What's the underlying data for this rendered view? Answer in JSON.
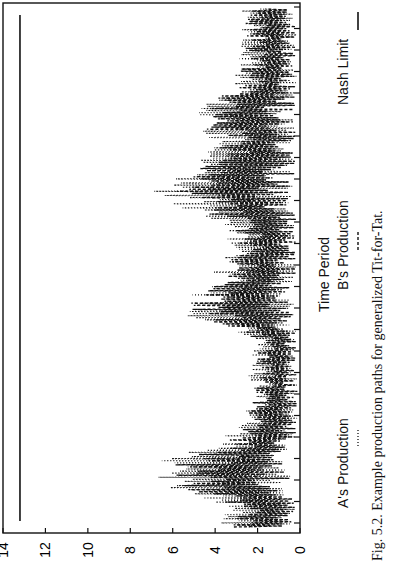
{
  "chart_data": {
    "type": "line",
    "orientation": "rotated-90-ccw",
    "title": "",
    "caption": "Fig. 5.2. Example production paths for generalized Tit-for-Tat.",
    "xlabel": "Time Period",
    "ylabel": "",
    "ylim": [
      0,
      14
    ],
    "yticks": [
      "0",
      "2",
      "4",
      "6",
      "8",
      "10",
      "12",
      "14"
    ],
    "grid": false,
    "legend": [
      {
        "name": "A's Production",
        "style": "dotted"
      },
      {
        "name": "B's Production",
        "style": "dashed"
      },
      {
        "name": "Nash Limit",
        "style": "solid"
      }
    ],
    "legend_position": "bottom",
    "x_range": [
      0,
      250
    ],
    "series": [
      {
        "name": "A's Production",
        "style": "dotted",
        "envelope": [
          [
            0,
            4.4
          ],
          [
            10,
            3.5
          ],
          [
            20,
            6.6
          ],
          [
            30,
            7.5
          ],
          [
            40,
            4.0
          ],
          [
            50,
            2.8
          ],
          [
            60,
            2.6
          ],
          [
            75,
            2.4
          ],
          [
            90,
            2.2
          ],
          [
            105,
            6.2
          ],
          [
            115,
            4.6
          ],
          [
            130,
            3.6
          ],
          [
            145,
            3.4
          ],
          [
            160,
            7.4
          ],
          [
            170,
            5.6
          ],
          [
            185,
            4.1
          ],
          [
            200,
            5.5
          ],
          [
            215,
            3.1
          ],
          [
            230,
            3.0
          ],
          [
            250,
            2.8
          ]
        ]
      },
      {
        "name": "B's Production",
        "style": "dashed",
        "envelope": [
          [
            0,
            3.8
          ],
          [
            10,
            3.2
          ],
          [
            20,
            6.2
          ],
          [
            30,
            6.0
          ],
          [
            40,
            3.6
          ],
          [
            50,
            2.6
          ],
          [
            60,
            2.4
          ],
          [
            75,
            2.1
          ],
          [
            90,
            2.0
          ],
          [
            105,
            6.0
          ],
          [
            115,
            4.2
          ],
          [
            130,
            3.3
          ],
          [
            145,
            3.0
          ],
          [
            160,
            6.2
          ],
          [
            170,
            5.4
          ],
          [
            185,
            3.8
          ],
          [
            200,
            5.2
          ],
          [
            215,
            2.9
          ],
          [
            230,
            2.7
          ],
          [
            250,
            2.6
          ]
        ]
      },
      {
        "name": "Nash Limit",
        "style": "solid",
        "value": 13.2
      }
    ]
  }
}
